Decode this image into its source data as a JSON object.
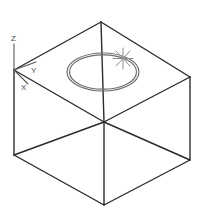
{
  "viewport": {
    "name": "isometric-model-viewport",
    "width": 203,
    "height": 220,
    "background_color": "#ffffff",
    "line_color": "#2b2b2b",
    "ucs_color": "#5a5a5a",
    "cursor_color": "#8c8c8c",
    "ellipse_color": "#6e6e6e"
  },
  "ucs_icon": {
    "label_z": "Z",
    "label_y": "Y",
    "label_x": "X",
    "origin": {
      "x": 14,
      "y": 70
    }
  },
  "cursor": {
    "type": "snap-crosshair-star",
    "x": 123,
    "y": 58
  },
  "solid": {
    "type": "box",
    "shading": "wireframe",
    "projection": "isometric",
    "vertices": {
      "top_center": {
        "x": 101,
        "y": 22
      },
      "top_left": {
        "x": 14,
        "y": 70
      },
      "top_right": {
        "x": 190,
        "y": 77
      },
      "top_front": {
        "x": 104,
        "y": 122
      },
      "bottom_left": {
        "x": 14,
        "y": 155
      },
      "bottom_right": {
        "x": 190,
        "y": 160
      },
      "bottom_front": {
        "x": 104,
        "y": 205
      }
    },
    "edges": [
      "top_left-top_center",
      "top_center-top_right",
      "top_left-top_front",
      "top_front-top_right",
      "top_center-top_front",
      "top_left-bottom_left",
      "top_right-bottom_right",
      "top_front-bottom_front",
      "bottom_left-bottom_front",
      "bottom_front-bottom_right",
      "bottom_left-top_front",
      "top_front-bottom_right"
    ]
  },
  "circle": {
    "type": "circle-on-top-face",
    "center": {
      "x": 103,
      "y": 72
    },
    "radius_x": 36,
    "radius_y": 19,
    "inner_radius_x": 33,
    "inner_radius_y": 17
  }
}
